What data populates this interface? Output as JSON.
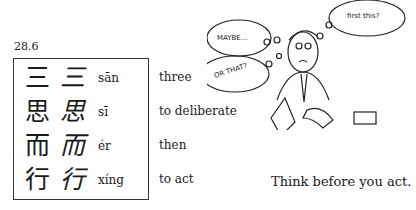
{
  "section": "28.6",
  "rows": [
    {
      "trad": "三",
      "cursive": "三",
      "pinyin": "sān",
      "meaning": "three"
    },
    {
      "trad": "思",
      "cursive": "思",
      "pinyin": "sī",
      "meaning": "to deliberate"
    },
    {
      "trad": "而",
      "cursive": "而",
      "pinyin": "ér",
      "meaning": "then"
    },
    {
      "trad": "行",
      "cursive": "行",
      "pinyin": "xíng",
      "meaning": "to act"
    }
  ],
  "illustration": {
    "bubbles": [
      "MAYBE...",
      "OR THAT?",
      "first this?"
    ]
  },
  "motto": "Think before you act."
}
